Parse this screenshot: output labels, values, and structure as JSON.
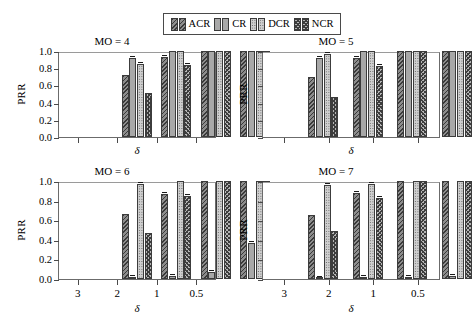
{
  "chart_data": {
    "type": "bar",
    "title": "",
    "layout": "2x2 grid of grouped bar panels",
    "legend": {
      "position": "top-center",
      "entries": [
        {
          "name": "ACR",
          "pattern": "diagonal-hatch"
        },
        {
          "name": "CR",
          "pattern": "solid-gray"
        },
        {
          "name": "DCR",
          "pattern": "dotted"
        },
        {
          "name": "NCR",
          "pattern": "crosshatch"
        }
      ]
    },
    "shared": {
      "xlabel": "δ",
      "ylabel": "PRR",
      "categories": [
        "3",
        "2",
        "1",
        "0.5"
      ],
      "ylim": [
        0.0,
        1.0
      ],
      "yticks": [
        "0.0",
        "0.2",
        "0.4",
        "0.6",
        "0.8",
        "1.0"
      ],
      "grid": false
    },
    "panels": [
      {
        "title": "MO = 4",
        "position": "top-left",
        "ytick_labels_visible": true,
        "xtick_labels_visible": false,
        "series": [
          {
            "name": "ACR",
            "values": [
              0.72,
              0.93,
              1.0,
              1.0
            ]
          },
          {
            "name": "CR",
            "values": [
              0.92,
              1.0,
              1.0,
              1.0
            ]
          },
          {
            "name": "DCR",
            "values": [
              0.85,
              1.0,
              1.0,
              1.0
            ]
          },
          {
            "name": "NCR",
            "values": [
              0.51,
              0.84,
              1.0,
              1.0
            ]
          }
        ]
      },
      {
        "title": "MO = 5",
        "position": "top-right",
        "ytick_labels_visible": false,
        "xtick_labels_visible": false,
        "series": [
          {
            "name": "ACR",
            "values": [
              0.7,
              0.92,
              1.0,
              1.0
            ]
          },
          {
            "name": "CR",
            "values": [
              0.92,
              1.0,
              1.0,
              1.0
            ]
          },
          {
            "name": "DCR",
            "values": [
              0.96,
              1.0,
              1.0,
              1.0
            ]
          },
          {
            "name": "NCR",
            "values": [
              0.47,
              0.83,
              1.0,
              1.0
            ]
          }
        ]
      },
      {
        "title": "MO = 6",
        "position": "bottom-left",
        "ytick_labels_visible": true,
        "xtick_labels_visible": true,
        "series": [
          {
            "name": "ACR",
            "values": [
              0.66,
              0.87,
              1.0,
              1.0
            ]
          },
          {
            "name": "CR",
            "values": [
              0.02,
              0.03,
              0.07,
              0.37
            ]
          },
          {
            "name": "DCR",
            "values": [
              0.97,
              1.0,
              1.0,
              1.0
            ]
          },
          {
            "name": "NCR",
            "values": [
              0.47,
              0.85,
              1.0,
              1.0
            ]
          }
        ]
      },
      {
        "title": "MO = 7",
        "position": "bottom-right",
        "ytick_labels_visible": false,
        "xtick_labels_visible": true,
        "series": [
          {
            "name": "ACR",
            "values": [
              0.65,
              0.88,
              1.0,
              1.0
            ]
          },
          {
            "name": "CR",
            "values": [
              0.01,
              0.02,
              0.02,
              0.03
            ]
          },
          {
            "name": "DCR",
            "values": [
              0.96,
              0.97,
              1.0,
              1.0
            ]
          },
          {
            "name": "NCR",
            "values": [
              0.49,
              0.83,
              1.0,
              1.0
            ]
          }
        ]
      }
    ]
  }
}
